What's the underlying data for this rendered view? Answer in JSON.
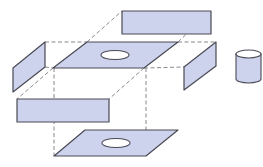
{
  "diagram": {
    "colors": {
      "fill": "#cdd3ec",
      "stroke": "#4a4a55",
      "dash": "#6a6a72",
      "hole": "#ffffff",
      "background": "#ffffff"
    },
    "parts": [
      {
        "id": "back-panel",
        "shape": "rectangle",
        "points": "122,11 211,11 211,34 122,34"
      },
      {
        "id": "left-panel",
        "shape": "parallelogram",
        "points": "13,68 45,42 45,67 13,92"
      },
      {
        "id": "top-panel",
        "shape": "parallelogram-with-hole",
        "points": "53,68 87,42 178,42 144,68"
      },
      {
        "id": "right-panel",
        "shape": "parallelogram",
        "points": "184,67 216,42 216,66 184,90"
      },
      {
        "id": "front-panel",
        "shape": "rectangle",
        "points": "17,99 109,99 109,122 17,122"
      },
      {
        "id": "bottom-panel",
        "shape": "parallelogram-with-hole",
        "points": "54,156 85,130 178,130 146,156"
      },
      {
        "id": "cylinder",
        "shape": "cylinder"
      }
    ],
    "holes": [
      {
        "id": "top-hole",
        "cx": 115,
        "cy": 55,
        "rx": 14,
        "ry": 4.5
      },
      {
        "id": "bottom-hole",
        "cx": 116,
        "cy": 143,
        "rx": 14,
        "ry": 4.5
      }
    ],
    "cylinder": {
      "cx": 248.5,
      "top_y": 54,
      "bottom_y": 79,
      "rx": 12.5,
      "ry": 4
    },
    "dashed_lines": [
      "45,42 87,42",
      "178,42 216,42",
      "87,42 122,11",
      "178,42 211,11",
      "45,67 53,68",
      "144,68 184,67",
      "53,68 17,99",
      "144,68 109,99",
      "54,68 54,156",
      "146,68 146,156"
    ]
  }
}
